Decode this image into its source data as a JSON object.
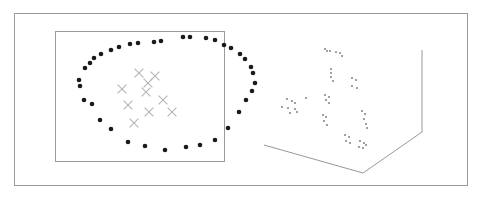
{
  "figure": {
    "title": "",
    "width": 484,
    "height": 202,
    "background": "#ffffff",
    "outer_frame": {
      "x": 14,
      "y": 13,
      "width": 454,
      "height": 173,
      "color": "#9a9a9a"
    }
  },
  "panels": [
    {
      "name": "left-panel-2d-scatter",
      "x": 55,
      "y": 31,
      "width": 170,
      "height": 131
    },
    {
      "name": "right-panel-3d-scatter",
      "x": 255,
      "y": 40,
      "width": 180,
      "height": 140
    }
  ],
  "colors": {
    "dot": "#1a1a1a",
    "cross": "#b4b4b4",
    "axis": "#8c8c8c",
    "frame": "#9a9a9a",
    "dot3d": "#6e6e6e"
  },
  "chart_data": [
    {
      "type": "scatter",
      "title": "",
      "subtitle": "",
      "xlabel": "",
      "ylabel": "",
      "xlim": [
        55,
        225
      ],
      "ylim": [
        31,
        162
      ],
      "grid": false,
      "legend": "none",
      "axes_box": {
        "x": 55,
        "y": 31,
        "width": 170,
        "height": 131
      },
      "series": [
        {
          "name": "ring-points",
          "marker": "filled-circle",
          "color": "#1a1a1a",
          "size": 2.3,
          "points": [
            [
              183,
              37
            ],
            [
              190,
              37
            ],
            [
              206,
              38
            ],
            [
              215,
              40
            ],
            [
              154,
              42
            ],
            [
              161,
              41
            ],
            [
              130,
              44
            ],
            [
              138,
              43
            ],
            [
              224,
              45
            ],
            [
              231,
              48
            ],
            [
              111,
              50
            ],
            [
              119,
              47
            ],
            [
              240,
              54
            ],
            [
              245,
              59
            ],
            [
              94,
              58
            ],
            [
              101,
              54
            ],
            [
              85,
              68
            ],
            [
              90,
              63
            ],
            [
              251,
              67
            ],
            [
              253,
              73
            ],
            [
              79,
              80
            ],
            [
              80,
              86
            ],
            [
              255,
              83
            ],
            [
              252,
              91
            ],
            [
              84,
              100
            ],
            [
              92,
              104
            ],
            [
              246,
              100
            ],
            [
              100,
              120
            ],
            [
              111,
              129
            ],
            [
              239,
              112
            ],
            [
              128,
              142
            ],
            [
              145,
              146
            ],
            [
              228,
              128
            ],
            [
              215,
              140
            ],
            [
              165,
              150
            ],
            [
              186,
              147
            ],
            [
              200,
              145
            ]
          ]
        },
        {
          "name": "cluster-crosses",
          "marker": "x",
          "color": "#b4b4b4",
          "size": 4.4,
          "points": [
            [
              139,
              73
            ],
            [
              155,
              76
            ],
            [
              148,
              83
            ],
            [
              146,
              92
            ],
            [
              122,
              89
            ],
            [
              128,
              105
            ],
            [
              149,
              112
            ],
            [
              163,
              100
            ],
            [
              172,
              112
            ],
            [
              134,
              123
            ]
          ]
        }
      ]
    },
    {
      "type": "scatter",
      "title": "",
      "subtitle": "",
      "xlabel": "",
      "ylabel": "",
      "zlabel": "",
      "projection": "3d",
      "grid": false,
      "legend": "none",
      "axis_lines": [
        {
          "name": "z-axis",
          "x1": 422,
          "y1": 50,
          "x2": 422,
          "y2": 132
        },
        {
          "name": "floor-right-edge",
          "x1": 422,
          "y1": 132,
          "x2": 363,
          "y2": 173
        },
        {
          "name": "floor-left-edge",
          "x1": 363,
          "y1": 173,
          "x2": 264,
          "y2": 145
        }
      ],
      "series": [
        {
          "name": "points-3d",
          "marker": "small-square",
          "color": "#6e6e6e",
          "size": 1.6,
          "points": [
            [
              325,
              95
            ],
            [
              329,
              97
            ],
            [
              326,
              100
            ],
            [
              329,
              103
            ],
            [
              306,
              98
            ],
            [
              287,
              99
            ],
            [
              292,
              101
            ],
            [
              295,
              103
            ],
            [
              282,
              107
            ],
            [
              288,
              108
            ],
            [
              295,
              109
            ],
            [
              290,
              113
            ],
            [
              297,
              112
            ],
            [
              325,
              49
            ],
            [
              327,
              51
            ],
            [
              330,
              51
            ],
            [
              336,
              52
            ],
            [
              340,
              53
            ],
            [
              342,
              56
            ],
            [
              323,
              115
            ],
            [
              326,
              117
            ],
            [
              324,
              121
            ],
            [
              327,
              125
            ],
            [
              331,
              69
            ],
            [
              331,
              73
            ],
            [
              331,
              77
            ],
            [
              333,
              81
            ],
            [
              352,
              78
            ],
            [
              356,
              80
            ],
            [
              352,
              86
            ],
            [
              357,
              88
            ],
            [
              362,
              111
            ],
            [
              365,
              114
            ],
            [
              364,
              119
            ],
            [
              366,
              124
            ],
            [
              367,
              128
            ],
            [
              345,
              135
            ],
            [
              349,
              137
            ],
            [
              346,
              141
            ],
            [
              350,
              143
            ],
            [
              360,
              141
            ],
            [
              364,
              143
            ],
            [
              366,
              145
            ],
            [
              359,
              147
            ],
            [
              363,
              148
            ]
          ]
        }
      ]
    }
  ]
}
